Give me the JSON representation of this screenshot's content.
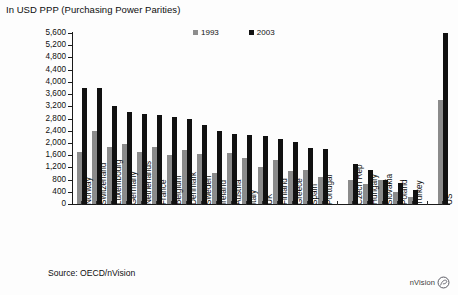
{
  "title": "In USD PPP (Purchasing Power Parities)",
  "source": "Source: OECD/nVision",
  "watermark": {
    "label": "nVision",
    "icon": "circle-swirl-icon"
  },
  "colors": {
    "series_1993": "#8b8b8b",
    "series_2003": "#111111",
    "axis": "#1a1a1a",
    "background": "#fdfdfd"
  },
  "legend": {
    "position": "top-center",
    "entries": [
      {
        "label": "1993",
        "color": "#8b8b8b"
      },
      {
        "label": "2003",
        "color": "#111111"
      }
    ]
  },
  "chart_data": {
    "type": "bar",
    "title": "In USD PPP (Purchasing Power Parities)",
    "xlabel": "",
    "ylabel": "",
    "ylim": [
      0,
      5600
    ],
    "ytick_step": 400,
    "grid": false,
    "legend_position": "top-center",
    "yticks": [
      "5,600",
      "5,200",
      "4,800",
      "4,400",
      "4,000",
      "3,600",
      "3,200",
      "2,800",
      "2,400",
      "2,000",
      "1,600",
      "1,200",
      "800",
      "400",
      "0"
    ],
    "ytick_values": [
      5600,
      5200,
      4800,
      4400,
      4000,
      3600,
      3200,
      2800,
      2400,
      2000,
      1600,
      1200,
      800,
      400,
      0
    ],
    "categories": [
      "Norway",
      "Switzerland",
      "Luxembourg",
      "Germany",
      "Netherlands",
      "France",
      "Belgium",
      "Denmark",
      "Sweden",
      "Ireland",
      "Austria",
      "Italy",
      "UK",
      "Finland",
      "Greece",
      "Spain",
      "Portugal",
      "",
      "Czech Rep",
      "Hungary",
      "Slovakia",
      "Poland",
      "Turkey",
      "",
      "US"
    ],
    "series": [
      {
        "name": "1993",
        "color": "#8b8b8b",
        "values": [
          1700,
          2380,
          1870,
          1980,
          1700,
          1860,
          1600,
          1760,
          1630,
          1020,
          1660,
          1520,
          1220,
          1430,
          1080,
          1100,
          880,
          null,
          780,
          640,
          780,
          400,
          230,
          null,
          3400
        ]
      },
      {
        "name": "2003",
        "color": "#111111",
        "values": [
          3800,
          3790,
          3200,
          3000,
          2960,
          2900,
          2840,
          2780,
          2600,
          2400,
          2290,
          2270,
          2230,
          2120,
          2020,
          1840,
          1810,
          null,
          1300,
          1130,
          790,
          700,
          450,
          null,
          5600
        ]
      }
    ]
  }
}
